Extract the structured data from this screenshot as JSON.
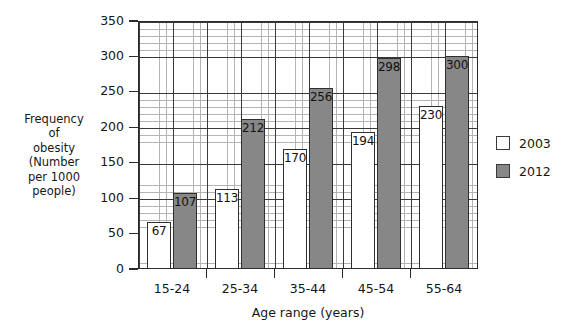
{
  "chart_data": {
    "type": "bar",
    "title": "",
    "categories": [
      "15-24",
      "25-34",
      "35-44",
      "45-54",
      "55-64"
    ],
    "series": [
      {
        "name": "2003",
        "values": [
          67,
          113,
          170,
          194,
          230
        ],
        "color": "#ffffff"
      },
      {
        "name": "2012",
        "values": [
          107,
          212,
          256,
          298,
          300
        ],
        "color": "#878787"
      }
    ],
    "xlabel": "Age range (years)",
    "ylabel": "Frequency of obesity (Number per 1000 people)",
    "ylabel_lines": "Frequency\nof\nobesity\n(Number\nper 1000\npeople)",
    "ylim": [
      0,
      350
    ],
    "ytick_labels": [
      "0",
      "50",
      "100",
      "150",
      "200",
      "250",
      "300",
      "350"
    ],
    "ytick_values": [
      0,
      50,
      100,
      150,
      200,
      250,
      300,
      350
    ],
    "grid": "major-and-minor",
    "minor_step": 10,
    "legend_position": "right",
    "legend_entries": [
      "2003",
      "2012"
    ]
  },
  "axes": {
    "y_title": "Frequency\nof\nobesity\n(Number\nper 1000\npeople)",
    "x_title": "Age range (years)"
  },
  "legend": {
    "entries": [
      {
        "label": "2003",
        "swatch": "white-square"
      },
      {
        "label": "2012",
        "swatch": "gray-square"
      }
    ]
  }
}
